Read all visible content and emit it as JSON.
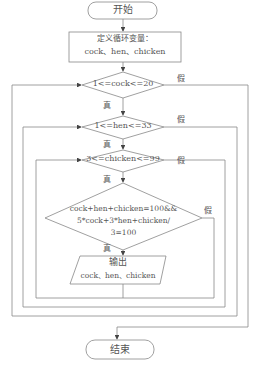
{
  "flowchart": {
    "start": "开始",
    "init_line1": "定义循环变量：",
    "init_line2": "cock、hen、chicken",
    "cond1": "1<=cock<=20",
    "cond2": "1<=hen<=33",
    "cond3": "3<=chicken<=99",
    "cond4_line1": "cock+hen+chicken=100&&",
    "cond4_line2": "5*cock+3*hen+chicken/",
    "cond4_line3": "3=100",
    "output_line1": "输出",
    "output_line2": "cock、hen、chicken",
    "end": "结束",
    "true_label": "真",
    "false_label": "假"
  },
  "colors": {
    "line": "#777777",
    "text": "#555555"
  }
}
